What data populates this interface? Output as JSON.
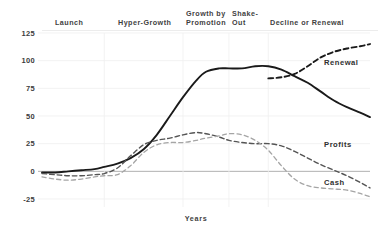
{
  "chart_data": {
    "type": "line",
    "title": "",
    "xlabel": "Years",
    "ylabel": "",
    "ylim": [
      -25,
      125
    ],
    "xlim": [
      0,
      100
    ],
    "grid": true,
    "legend_position": "inline-right-of-series",
    "y_ticks": [
      "125",
      "100",
      "75",
      "50",
      "25",
      "0",
      "-25"
    ],
    "y_tick_values": [
      125,
      100,
      75,
      50,
      25,
      0,
      -25
    ],
    "stages": [
      {
        "label": "Launch",
        "x_start": 0,
        "x_end": 19
      },
      {
        "label": "Hyper-Growth",
        "x_start": 19,
        "x_end": 43
      },
      {
        "label": "Growth by Promotion",
        "x_start": 43,
        "x_end": 57
      },
      {
        "label": "Shake-Out",
        "x_start": 57,
        "x_end": 69
      },
      {
        "label": "Decline or Renewal",
        "x_start": 69,
        "x_end": 100
      }
    ],
    "series": [
      {
        "name": "Sales",
        "label": "",
        "style": "solid",
        "color": "#1a1a1a",
        "x": [
          0,
          4,
          8,
          12,
          16,
          19,
          23,
          27,
          31,
          35,
          39,
          43,
          47,
          50,
          54,
          57,
          61,
          65,
          69,
          73,
          77,
          81,
          85,
          89,
          93,
          97,
          100
        ],
        "values": [
          -1,
          -1,
          0,
          1,
          2,
          4,
          7,
          12,
          20,
          33,
          50,
          67,
          82,
          90,
          93,
          93,
          93,
          95,
          95,
          92,
          86,
          80,
          72,
          64,
          58,
          53,
          49
        ]
      },
      {
        "name": "Renewal",
        "label": "Renewal",
        "style": "dashed",
        "color": "#1a1a1a",
        "x": [
          69,
          73,
          77,
          81,
          85,
          89,
          93,
          97,
          100
        ],
        "values": [
          84,
          85,
          88,
          95,
          103,
          108,
          111,
          113,
          115
        ]
      },
      {
        "name": "Profits",
        "label": "Profits",
        "style": "dashed",
        "color": "#545454",
        "x": [
          0,
          4,
          8,
          12,
          16,
          19,
          23,
          27,
          31,
          35,
          39,
          43,
          47,
          50,
          54,
          57,
          61,
          65,
          69,
          73,
          77,
          81,
          85,
          89,
          93,
          97,
          100
        ],
        "values": [
          -2,
          -3,
          -4,
          -4,
          -3,
          -2,
          3,
          14,
          24,
          28,
          30,
          33,
          35,
          34,
          31,
          28,
          26,
          25,
          25,
          23,
          18,
          12,
          6,
          1,
          -4,
          -10,
          -15
        ]
      },
      {
        "name": "Cash",
        "label": "Cash",
        "style": "dashed",
        "color": "#a5a5a5",
        "x": [
          0,
          4,
          8,
          12,
          16,
          19,
          23,
          27,
          31,
          35,
          39,
          43,
          47,
          50,
          54,
          57,
          61,
          65,
          69,
          73,
          77,
          81,
          85,
          89,
          93,
          97,
          100
        ],
        "values": [
          -5,
          -7,
          -8,
          -7,
          -5,
          -4,
          -3,
          5,
          17,
          24,
          26,
          26,
          28,
          30,
          32,
          34,
          33,
          28,
          19,
          5,
          -7,
          -13,
          -15,
          -16,
          -17,
          -20,
          -23
        ]
      }
    ],
    "series_labels": [
      {
        "name": "Renewal",
        "x": 86,
        "y": 96
      },
      {
        "name": "Profits",
        "x": 86,
        "y": 22
      },
      {
        "name": "Cash",
        "x": 86,
        "y": -12
      }
    ]
  }
}
